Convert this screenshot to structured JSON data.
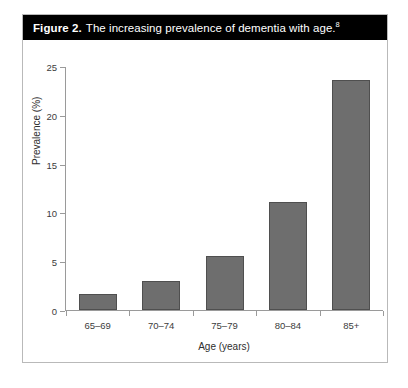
{
  "caption": {
    "figure_number": "Figure 2.",
    "text": "The increasing prevalence of dementia with age.",
    "superscript": "8"
  },
  "colors": {
    "caption_bar_background": "#000000",
    "caption_text": "#ffffff",
    "bar_fill": "#6e6e6e",
    "bar_border": "#4f4f4f",
    "axis_line": "#9a9a9a",
    "frame_border": "#b9b9b9",
    "page_background": "#ffffff"
  },
  "chart_data": {
    "type": "bar",
    "title": "The increasing prevalence of dementia with age.",
    "subtitle": "",
    "categories": [
      "65–69",
      "70–74",
      "75–79",
      "80–84",
      "85+"
    ],
    "values": [
      1.6,
      3.0,
      5.6,
      11.1,
      23.7
    ],
    "xlabel": "Age (years)",
    "ylabel": "Prevalence (%)",
    "ylim": [
      0,
      25
    ],
    "yticks": [
      0,
      5,
      10,
      15,
      20,
      25
    ],
    "ytick_labels": [
      "0",
      "5",
      "10",
      "15",
      "20",
      "25"
    ],
    "grid": false,
    "legend": false,
    "legend_position": "none",
    "annotations": []
  }
}
